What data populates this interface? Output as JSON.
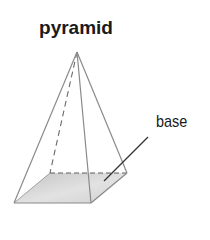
{
  "diagram": {
    "title": "pyramid",
    "labels": {
      "base": "base"
    },
    "colors": {
      "edge": "#8a8a8a",
      "hidden_edge": "#6a6a6a",
      "base_fill_light": "#ececec",
      "base_fill_dark": "#bdbdbd",
      "leader": "#333333",
      "text": "#1a1a1a"
    },
    "shape": "square pyramid",
    "visible_edges": [
      "apex-front-left",
      "apex-front-right",
      "apex-back-right",
      "front-left-front-right",
      "front-right-back-right",
      "front-left-back-left"
    ],
    "hidden_edges": [
      "apex-back-left",
      "back-left-back-right"
    ]
  }
}
